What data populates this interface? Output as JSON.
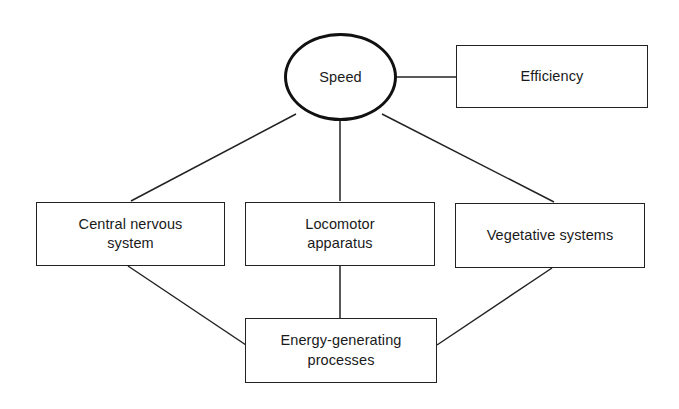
{
  "diagram": {
    "type": "node-link-diagram",
    "background_color": "#ffffff",
    "stroke_color": "#222222",
    "text_color": "#1a1a1a",
    "nodes": [
      {
        "id": "speed",
        "label": "Speed",
        "shape": "circle",
        "x": 284,
        "y": 33,
        "width": 113,
        "height": 88
      },
      {
        "id": "efficiency",
        "label": "Efficiency",
        "shape": "rectangle",
        "x": 456,
        "y": 45,
        "width": 192,
        "height": 63
      },
      {
        "id": "cns",
        "label": "Central nervous\nsystem",
        "shape": "rectangle",
        "x": 36,
        "y": 202,
        "width": 189,
        "height": 64
      },
      {
        "id": "locomotor",
        "label": "Locomotor\napparatus",
        "shape": "rectangle",
        "x": 245,
        "y": 202,
        "width": 190,
        "height": 64
      },
      {
        "id": "vegetative",
        "label": "Vegetative systems",
        "shape": "rectangle",
        "x": 455,
        "y": 203,
        "width": 190,
        "height": 65
      },
      {
        "id": "energy",
        "label": "Energy-generating\nprocesses",
        "shape": "rectangle",
        "x": 245,
        "y": 318,
        "width": 192,
        "height": 65
      }
    ],
    "edges": [
      {
        "id": "speed-efficiency",
        "from": "speed",
        "to": "efficiency",
        "x1": 396,
        "y1": 77,
        "x2": 457,
        "y2": 77
      },
      {
        "id": "speed-cns",
        "from": "speed",
        "to": "cns",
        "x1": 296,
        "y1": 114,
        "x2": 131,
        "y2": 201
      },
      {
        "id": "speed-locomotor",
        "from": "speed",
        "to": "locomotor",
        "x1": 340,
        "y1": 121,
        "x2": 340,
        "y2": 201
      },
      {
        "id": "speed-vegetative",
        "from": "speed",
        "to": "vegetative",
        "x1": 382,
        "y1": 114,
        "x2": 554,
        "y2": 202
      },
      {
        "id": "cns-energy",
        "from": "cns",
        "to": "energy",
        "x1": 128,
        "y1": 266,
        "x2": 246,
        "y2": 345
      },
      {
        "id": "locomotor-energy",
        "from": "locomotor",
        "to": "energy",
        "x1": 340,
        "y1": 266,
        "x2": 340,
        "y2": 318
      },
      {
        "id": "vegetative-energy",
        "from": "vegetative",
        "to": "energy",
        "x1": 552,
        "y1": 268,
        "x2": 437,
        "y2": 345
      }
    ]
  }
}
